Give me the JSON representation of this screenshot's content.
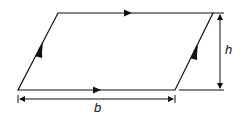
{
  "diagram": {
    "type": "parallelogram",
    "labels": {
      "base": "b",
      "height": "h"
    },
    "colors": {
      "stroke": "#111111",
      "background": "#ffffff"
    },
    "annotations": {
      "parallel_marks_horizontal": "single arrow",
      "parallel_marks_slanted": "double arrow"
    }
  }
}
